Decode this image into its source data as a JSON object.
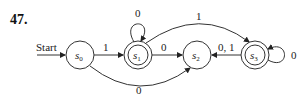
{
  "problem_number": "47.",
  "start_label": "Start",
  "states": [
    {
      "id": "s0",
      "name": "s",
      "sub": "0",
      "accepting": false,
      "start": true
    },
    {
      "id": "s1",
      "name": "s",
      "sub": "1",
      "accepting": true,
      "start": false
    },
    {
      "id": "s2",
      "name": "s",
      "sub": "2",
      "accepting": false,
      "start": false
    },
    {
      "id": "s3",
      "name": "s",
      "sub": "3",
      "accepting": true,
      "start": false
    }
  ],
  "transitions": [
    {
      "from": "s0",
      "to": "s1",
      "label": "1"
    },
    {
      "from": "s0",
      "to": "s2",
      "label": "0"
    },
    {
      "from": "s1",
      "to": "s1",
      "label": "0"
    },
    {
      "from": "s1",
      "to": "s2",
      "label": "0"
    },
    {
      "from": "s1",
      "to": "s3",
      "label": "1"
    },
    {
      "from": "s3",
      "to": "s2",
      "label": "0, 1"
    },
    {
      "from": "s3",
      "to": "s3",
      "label": "0"
    }
  ]
}
